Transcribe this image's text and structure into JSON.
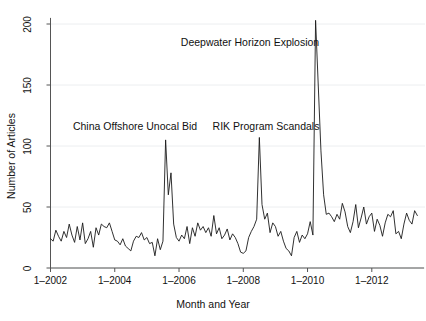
{
  "chart_data": {
    "type": "line",
    "title": "",
    "xlabel": "Month and Year",
    "ylabel": "Number of Articles",
    "xtick_labels": [
      "1–2002",
      "1–2004",
      "1–2006",
      "1–2008",
      "1–2010",
      "1–2012"
    ],
    "xtick_values": [
      2002.0,
      2004.0,
      2006.0,
      2008.0,
      2010.0,
      2012.0
    ],
    "ytick_labels": [
      "0",
      "50",
      "100",
      "150",
      "200"
    ],
    "ytick_values": [
      0,
      50,
      100,
      150,
      200
    ],
    "xlim": [
      2002.0,
      2013.5
    ],
    "ylim": [
      0,
      210
    ],
    "grid": true,
    "grid_axis": "y",
    "legend": "none",
    "line_color": "#1a1a1a",
    "line_width": 0.9,
    "series": [
      {
        "name": "Number of Articles",
        "x": [
          2002.0,
          2002.083,
          2002.167,
          2002.25,
          2002.333,
          2002.417,
          2002.5,
          2002.583,
          2002.667,
          2002.75,
          2002.833,
          2002.917,
          2003.0,
          2003.083,
          2003.167,
          2003.25,
          2003.333,
          2003.417,
          2003.5,
          2003.583,
          2003.667,
          2003.75,
          2003.833,
          2003.917,
          2004.0,
          2004.083,
          2004.167,
          2004.25,
          2004.333,
          2004.417,
          2004.5,
          2004.583,
          2004.667,
          2004.75,
          2004.833,
          2004.917,
          2005.0,
          2005.083,
          2005.167,
          2005.25,
          2005.333,
          2005.417,
          2005.5,
          2005.583,
          2005.667,
          2005.75,
          2005.833,
          2005.917,
          2006.0,
          2006.083,
          2006.167,
          2006.25,
          2006.333,
          2006.417,
          2006.5,
          2006.583,
          2006.667,
          2006.75,
          2006.833,
          2006.917,
          2007.0,
          2007.083,
          2007.167,
          2007.25,
          2007.333,
          2007.417,
          2007.5,
          2007.583,
          2007.667,
          2007.75,
          2007.833,
          2007.917,
          2008.0,
          2008.083,
          2008.167,
          2008.25,
          2008.333,
          2008.417,
          2008.5,
          2008.583,
          2008.667,
          2008.75,
          2008.833,
          2008.917,
          2009.0,
          2009.083,
          2009.167,
          2009.25,
          2009.333,
          2009.417,
          2009.5,
          2009.583,
          2009.667,
          2009.75,
          2009.833,
          2009.917,
          2010.0,
          2010.083,
          2010.167,
          2010.25,
          2010.333,
          2010.417,
          2010.5,
          2010.583,
          2010.667,
          2010.75,
          2010.833,
          2010.917,
          2011.0,
          2011.083,
          2011.167,
          2011.25,
          2011.333,
          2011.417,
          2011.5,
          2011.583,
          2011.667,
          2011.75,
          2011.833,
          2011.917,
          2012.0,
          2012.083,
          2012.167,
          2012.25,
          2012.333,
          2012.417,
          2012.5,
          2012.583,
          2012.667,
          2012.75,
          2012.833,
          2012.917,
          2013.0,
          2013.083,
          2013.167,
          2013.25,
          2013.333,
          2013.417
        ],
        "values": [
          24,
          22,
          31,
          26,
          22,
          30,
          25,
          36,
          27,
          21,
          34,
          23,
          37,
          20,
          24,
          30,
          17,
          33,
          27,
          36,
          34,
          33,
          37,
          30,
          23,
          22,
          19,
          24,
          18,
          16,
          14,
          22,
          26,
          25,
          29,
          23,
          25,
          20,
          21,
          10,
          24,
          15,
          22,
          105,
          60,
          78,
          36,
          25,
          22,
          27,
          24,
          34,
          20,
          33,
          26,
          37,
          31,
          34,
          29,
          33,
          26,
          43,
          28,
          33,
          24,
          27,
          32,
          23,
          28,
          25,
          20,
          13,
          12,
          14,
          25,
          30,
          34,
          40,
          107,
          52,
          40,
          45,
          29,
          37,
          34,
          26,
          30,
          22,
          16,
          14,
          10,
          25,
          30,
          21,
          27,
          24,
          28,
          38,
          27,
          203,
          150,
          96,
          60,
          44,
          45,
          42,
          38,
          44,
          40,
          53,
          46,
          34,
          29,
          38,
          52,
          33,
          41,
          50,
          36,
          42,
          45,
          30,
          40,
          35,
          26,
          37,
          44,
          42,
          47,
          28,
          30,
          24,
          36,
          45,
          39,
          36,
          47,
          43
        ]
      }
    ],
    "annotations": [
      {
        "text": "Deepwater Horizon Explosion",
        "x": 2009.1,
        "y": 186,
        "anchor_px_x": 250,
        "anchor_px_y": 43
      },
      {
        "text": "China Offshore Unocal Bid",
        "x": 2004.1,
        "y": 115,
        "anchor_px_x": 135,
        "anchor_px_y": 127
      },
      {
        "text": "RIK Program Scandals",
        "x": 2007.6,
        "y": 115,
        "anchor_px_x": 266,
        "anchor_px_y": 127
      }
    ]
  }
}
